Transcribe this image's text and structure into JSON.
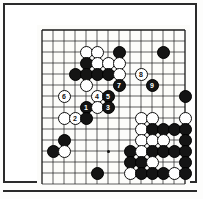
{
  "figure": {
    "kind": "go-board-diagram",
    "caption": "",
    "background_color": "#ffffff",
    "frame_color": "#2b2b2b"
  },
  "board": {
    "origin_x": 32,
    "origin_y": 20,
    "cell": 11,
    "cols": 14,
    "rows": 15,
    "line_color": "#1a1a1a",
    "board_color": "#fcfcfa",
    "black_color": "#141414",
    "white_color": "#ffffff",
    "hoshi": [
      {
        "c": 2,
        "r": 11
      },
      {
        "c": 6,
        "r": 4
      },
      {
        "c": 6,
        "r": 11
      }
    ]
  },
  "stones": [
    {
      "c": 4,
      "r": 2,
      "color": "white",
      "label": ""
    },
    {
      "c": 5,
      "r": 2,
      "color": "white",
      "label": ""
    },
    {
      "c": 7,
      "r": 2,
      "color": "black",
      "label": ""
    },
    {
      "c": 11,
      "r": 2,
      "color": "black",
      "label": ""
    },
    {
      "c": 4,
      "r": 3,
      "color": "black",
      "label": ""
    },
    {
      "c": 5,
      "r": 3,
      "color": "white",
      "label": ""
    },
    {
      "c": 6,
      "r": 3,
      "color": "white",
      "label": ""
    },
    {
      "c": 7,
      "r": 3,
      "color": "white",
      "label": ""
    },
    {
      "c": 3,
      "r": 4,
      "color": "black",
      "label": ""
    },
    {
      "c": 4,
      "r": 4,
      "color": "black",
      "label": ""
    },
    {
      "c": 5,
      "r": 4,
      "color": "black",
      "label": ""
    },
    {
      "c": 6,
      "r": 4,
      "color": "black",
      "label": ""
    },
    {
      "c": 7,
      "r": 4,
      "color": "white",
      "label": ""
    },
    {
      "c": 9,
      "r": 4,
      "color": "white",
      "label": "8"
    },
    {
      "c": 4,
      "r": 5,
      "color": "white",
      "label": ""
    },
    {
      "c": 7,
      "r": 5,
      "color": "black",
      "label": "7"
    },
    {
      "c": 10,
      "r": 5,
      "color": "black",
      "label": "9"
    },
    {
      "c": 2,
      "r": 6,
      "color": "white",
      "label": "6"
    },
    {
      "c": 5,
      "r": 6,
      "color": "white",
      "label": "4"
    },
    {
      "c": 6,
      "r": 6,
      "color": "black",
      "label": "5"
    },
    {
      "c": 4,
      "r": 7,
      "color": "black",
      "label": "1"
    },
    {
      "c": 5,
      "r": 7,
      "color": "white",
      "label": ""
    },
    {
      "c": 6,
      "r": 7,
      "color": "black",
      "label": "3"
    },
    {
      "c": 2,
      "r": 8,
      "color": "white",
      "label": ""
    },
    {
      "c": 3,
      "r": 8,
      "color": "white",
      "label": "2"
    },
    {
      "c": 4,
      "r": 8,
      "color": "black",
      "label": ""
    },
    {
      "c": 2,
      "r": 10,
      "color": "black",
      "label": ""
    },
    {
      "c": 1,
      "r": 11,
      "color": "black",
      "label": ""
    },
    {
      "c": 2,
      "r": 11,
      "color": "white",
      "label": ""
    },
    {
      "c": 5,
      "r": 13,
      "color": "black",
      "label": ""
    },
    {
      "c": 13,
      "r": 6,
      "color": "black",
      "label": ""
    },
    {
      "c": 9,
      "r": 8,
      "color": "white",
      "label": ""
    },
    {
      "c": 10,
      "r": 8,
      "color": "white",
      "label": ""
    },
    {
      "c": 13,
      "r": 8,
      "color": "white",
      "label": ""
    },
    {
      "c": 9,
      "r": 9,
      "color": "white",
      "label": ""
    },
    {
      "c": 10,
      "r": 9,
      "color": "black",
      "label": ""
    },
    {
      "c": 11,
      "r": 9,
      "color": "black",
      "label": ""
    },
    {
      "c": 12,
      "r": 9,
      "color": "black",
      "label": ""
    },
    {
      "c": 13,
      "r": 9,
      "color": "black",
      "label": ""
    },
    {
      "c": 9,
      "r": 10,
      "color": "white",
      "label": ""
    },
    {
      "c": 10,
      "r": 10,
      "color": "white",
      "label": ""
    },
    {
      "c": 11,
      "r": 10,
      "color": "white",
      "label": ""
    },
    {
      "c": 13,
      "r": 10,
      "color": "black",
      "label": ""
    },
    {
      "c": 8,
      "r": 11,
      "color": "black",
      "label": ""
    },
    {
      "c": 9,
      "r": 11,
      "color": "white",
      "label": ""
    },
    {
      "c": 10,
      "r": 11,
      "color": "black",
      "label": ""
    },
    {
      "c": 11,
      "r": 11,
      "color": "black",
      "label": ""
    },
    {
      "c": 12,
      "r": 11,
      "color": "black",
      "label": ""
    },
    {
      "c": 13,
      "r": 11,
      "color": "black",
      "label": ""
    },
    {
      "c": 8,
      "r": 12,
      "color": "black",
      "label": ""
    },
    {
      "c": 9,
      "r": 12,
      "color": "black",
      "label": ""
    },
    {
      "c": 10,
      "r": 12,
      "color": "white",
      "label": ""
    },
    {
      "c": 13,
      "r": 12,
      "color": "black",
      "label": ""
    },
    {
      "c": 8,
      "r": 13,
      "color": "white",
      "label": ""
    },
    {
      "c": 9,
      "r": 13,
      "color": "black",
      "label": ""
    },
    {
      "c": 10,
      "r": 13,
      "color": "black",
      "label": ""
    },
    {
      "c": 11,
      "r": 13,
      "color": "black",
      "label": ""
    },
    {
      "c": 12,
      "r": 13,
      "color": "white",
      "label": ""
    },
    {
      "c": 13,
      "r": 13,
      "color": "black",
      "label": ""
    }
  ]
}
